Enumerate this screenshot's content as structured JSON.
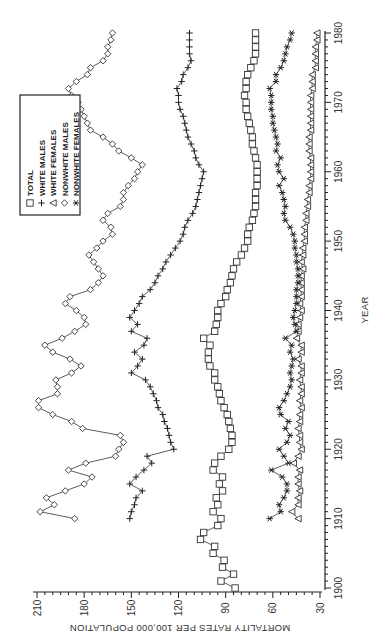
{
  "chart_data": {
    "type": "line",
    "orientation": "rotated-90-ccw",
    "title": "",
    "xlabel": "YEAR",
    "ylabel": "MORTALITY RATES PER 100,000 POPULATION",
    "xlim": [
      1900,
      1980
    ],
    "ylim": [
      30,
      210
    ],
    "x_ticks": [
      1900,
      1910,
      1920,
      1930,
      1940,
      1950,
      1960,
      1970,
      1980
    ],
    "y_ticks": [
      30,
      60,
      90,
      120,
      150,
      180,
      210
    ],
    "grid": false,
    "legend_position": "upper-left (rotated)",
    "legend": [
      {
        "name": "TOTAL",
        "marker": "square"
      },
      {
        "name": "WHITE MALES",
        "marker": "plus"
      },
      {
        "name": "WHITE FEMALES",
        "marker": "triangle"
      },
      {
        "name": "NONWHITE MALES",
        "marker": "diamond"
      },
      {
        "name": "NONWHITE FEMALES",
        "marker": "asterisk"
      }
    ],
    "series": [
      {
        "name": "TOTAL",
        "marker": "square",
        "start_year": 1900,
        "values": [
          84,
          93,
          85,
          92,
          91,
          98,
          97,
          106,
          104,
          95,
          93,
          98,
          95,
          96,
          92,
          94,
          92,
          98,
          97,
          93,
          88,
          86,
          86,
          87,
          88,
          89,
          91,
          93,
          94,
          95,
          97,
          97,
          100,
          101,
          101,
          100,
          104,
          97,
          96,
          95,
          95,
          93,
          90,
          89,
          87,
          86,
          85,
          83,
          80,
          78,
          76,
          76,
          75,
          73,
          72,
          71,
          71,
          71,
          70,
          70,
          70,
          70,
          71,
          72,
          73,
          73,
          74,
          75,
          76,
          77,
          77,
          78,
          77,
          77,
          76,
          74,
          72,
          71,
          71,
          71,
          71
        ]
      },
      {
        "name": "WHITE MALES",
        "marker": "plus",
        "start_year": 1910,
        "values": [
          151,
          150,
          148,
          147,
          143,
          151,
          147,
          142,
          137,
          140,
          123,
          125,
          126,
          127,
          129,
          130,
          133,
          134,
          136,
          138,
          141,
          150,
          146,
          143,
          148,
          142,
          140,
          150,
          146,
          151,
          148,
          145,
          143,
          138,
          135,
          133,
          130,
          128,
          125,
          122,
          119,
          117,
          116,
          114,
          111,
          109,
          108,
          107,
          106,
          105,
          104,
          107,
          109,
          110,
          112,
          114,
          115,
          116,
          117,
          119,
          120,
          120,
          121,
          118,
          117,
          114,
          112,
          113,
          113,
          113,
          113
        ]
      },
      {
        "name": "WHITE FEMALES",
        "marker": "triangle",
        "start_year": 1910,
        "values": [
          44,
          48,
          44,
          44,
          43,
          44,
          44,
          43,
          47,
          44,
          42,
          43,
          43,
          44,
          43,
          43,
          42,
          43,
          42,
          42,
          43,
          42,
          42,
          44,
          42,
          42,
          45,
          44,
          44,
          43,
          42,
          43,
          42,
          42,
          42,
          42,
          41,
          42,
          41,
          41,
          40,
          40,
          40,
          39,
          39,
          38,
          38,
          37,
          37,
          36,
          36,
          36,
          36,
          37,
          37,
          37,
          36,
          36,
          36,
          36,
          36,
          36,
          35,
          35,
          35,
          33,
          33,
          33,
          33,
          32,
          32
        ]
      },
      {
        "name": "NONWHITE MALES",
        "marker": "diamond",
        "start_year": 1910,
        "values": [
          186,
          208,
          199,
          204,
          192,
          180,
          175,
          190,
          179,
          160,
          158,
          155,
          157,
          181,
          188,
          200,
          209,
          209,
          197,
          197,
          198,
          188,
          182,
          189,
          200,
          205,
          194,
          186,
          179,
          180,
          185,
          192,
          189,
          176,
          171,
          168,
          171,
          174,
          177,
          172,
          168,
          162,
          163,
          168,
          165,
          157,
          155,
          155,
          152,
          148,
          146,
          143,
          150,
          158,
          162,
          168,
          176,
          178,
          180,
          182,
          184,
          188,
          190,
          185,
          178,
          176,
          168,
          165,
          165,
          163,
          162
        ]
      },
      {
        "name": "NONWHITE FEMALES",
        "marker": "asterisk",
        "start_year": 1910,
        "values": [
          62,
          55,
          56,
          53,
          51,
          51,
          54,
          61,
          50,
          53,
          56,
          51,
          49,
          52,
          50,
          55,
          56,
          53,
          51,
          49,
          48,
          49,
          48,
          47,
          49,
          48,
          52,
          45,
          46,
          47,
          46,
          45,
          45,
          45,
          44,
          44,
          44,
          45,
          45,
          46,
          46,
          47,
          49,
          52,
          53,
          52,
          53,
          54,
          56,
          53,
          56,
          57,
          55,
          58,
          57,
          58,
          59,
          60,
          60,
          61,
          61,
          61,
          62,
          58,
          58,
          55,
          53,
          52,
          51,
          49,
          48
        ]
      }
    ]
  }
}
